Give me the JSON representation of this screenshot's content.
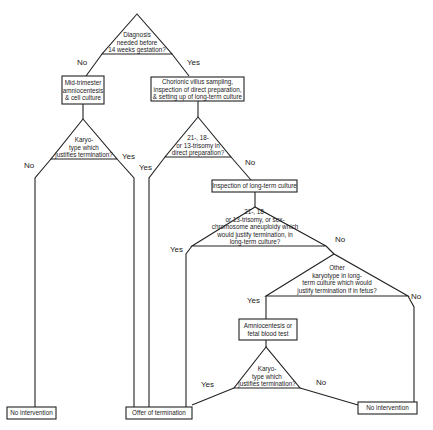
{
  "diagram": {
    "type": "flowchart",
    "nodes": {
      "q_diagnosis": {
        "lines": [
          "Diagnosis",
          "needed before",
          "14 weeks gestation?"
        ]
      },
      "box_midtrimester": {
        "lines": [
          "Mid-trimester",
          "amniocentesis",
          "& cell culture"
        ]
      },
      "box_cvs": {
        "lines": [
          "Chorionic villus sampling,",
          "inspection of direct preparation,",
          "& setting up of long-term culture"
        ]
      },
      "q_karyo_left": {
        "lines": [
          "Karyo-",
          "type which",
          "justifies termination?"
        ]
      },
      "q_trisomy_direct": {
        "lines": [
          "21-, 18-",
          "or 13-trisomy in",
          "direct preparation?"
        ]
      },
      "box_longterm": {
        "label": "Inspection of long-term culture"
      },
      "q_trisomy_long": {
        "lines": [
          "21-, 18-",
          "or 13-trisomy, or sex-",
          "chromosome aneuploidy which",
          "would justify termination, in",
          "long-term culture?"
        ]
      },
      "q_other_karyo": {
        "lines": [
          "Other",
          "karyotype in long-",
          "term culture which would",
          "justify termination if in fetus?"
        ]
      },
      "box_amnio_fbs": {
        "lines": [
          "Amniocentesis or",
          "fetal blood test"
        ]
      },
      "q_karyo_bottom": {
        "lines": [
          "Karyo-",
          "type which",
          "justifies termination?"
        ]
      },
      "out_no_intervention_left": {
        "label": "No intervention"
      },
      "out_offer_termination": {
        "label": "Offer of termination"
      },
      "out_no_intervention_right": {
        "label": "No intervention"
      }
    },
    "edge_labels": {
      "diag_no": "No",
      "diag_yes": "Yes",
      "karyo_left_no": "No",
      "karyo_left_yes": "Yes",
      "direct_yes": "Yes",
      "direct_no": "No",
      "long_yes": "Yes",
      "long_no": "No",
      "other_yes": "Yes",
      "other_no": "No",
      "karyo_bottom_yes": "Yes",
      "karyo_bottom_no": "No"
    }
  }
}
